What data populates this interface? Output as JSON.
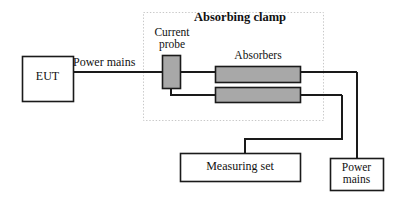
{
  "diagram": {
    "colors": {
      "line": "#1a1a1a",
      "absorber_fill": "#a8a8a8",
      "probe_fill": "#a8a8a8",
      "clamp_border": "#c8c8c8",
      "background": "#ffffff",
      "text": "#111111"
    },
    "clamp": {
      "title": "Absorbing clamp",
      "probe_label_line1": "Current",
      "probe_label_line2": "probe",
      "absorbers_label": "Absorbers"
    },
    "boxes": {
      "eut": "EUT",
      "measuring_set": "Measuring set",
      "power_mains_line1": "Power",
      "power_mains_line2": "mains"
    },
    "wires": {
      "power_mains_label": "Power mains"
    }
  }
}
